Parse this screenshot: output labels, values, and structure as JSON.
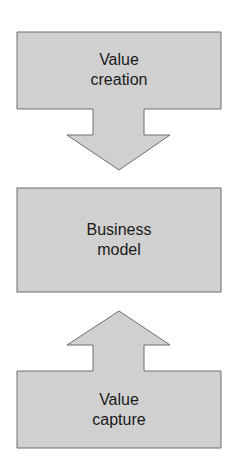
{
  "diagram": {
    "fill_color": "#d0d0d0",
    "stroke_color": "#6e6e6e",
    "top": {
      "line1": "Value",
      "line2": "creation",
      "arrow": "down"
    },
    "middle": {
      "line1": "Business",
      "line2": "model"
    },
    "bottom": {
      "line1": "Value",
      "line2": "capture",
      "arrow": "up"
    }
  }
}
